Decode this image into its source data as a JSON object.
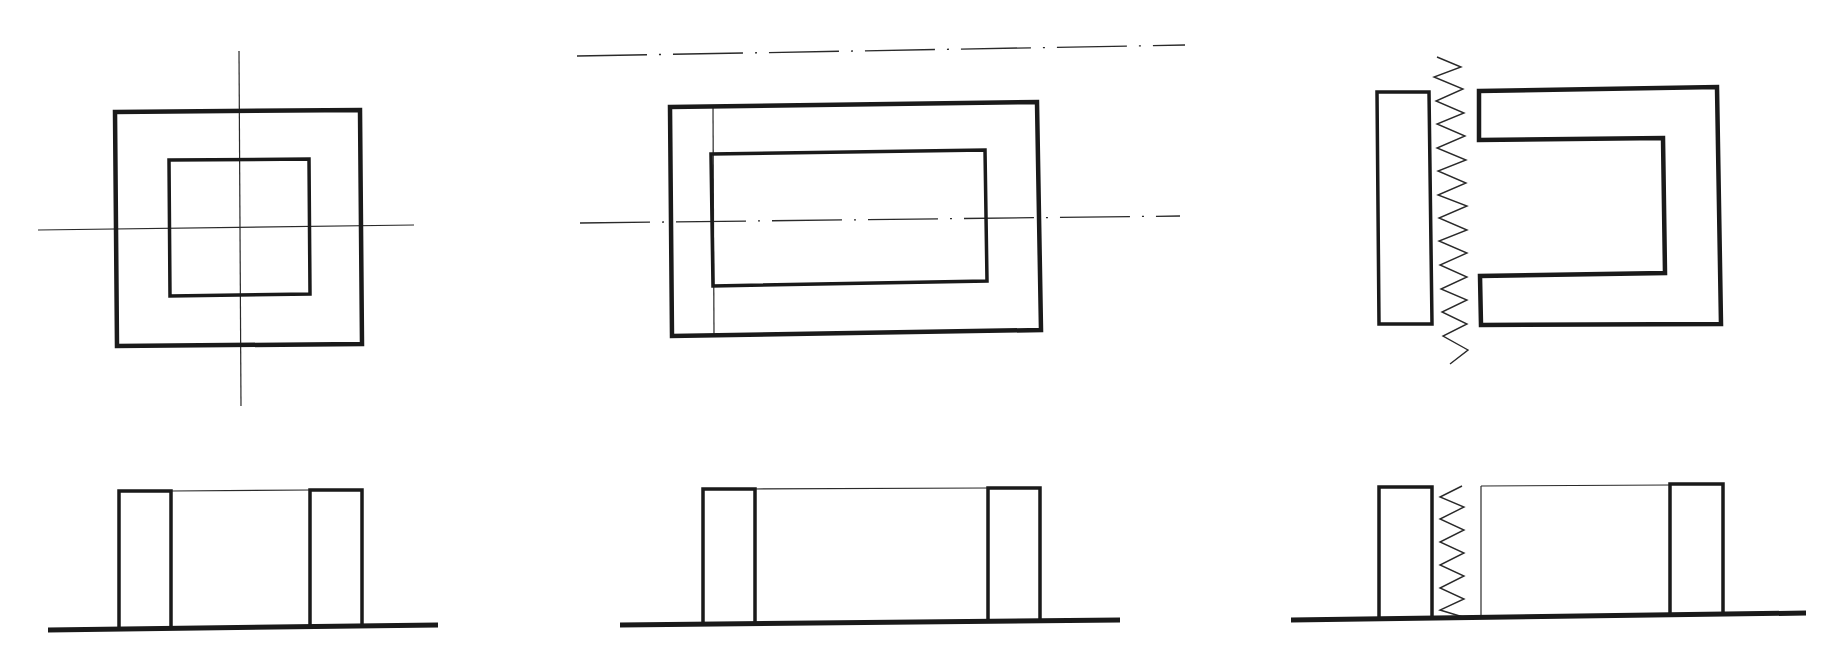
{
  "figure": {
    "title": "",
    "colors": {
      "background": "#ffffff",
      "stroke": "#1a1a1a",
      "thin_stroke": "#2a2a2a"
    }
  },
  "views": {
    "fig1_plan": {
      "outer": "M115,112 L360,110 L362,344 L117,346 Z",
      "inner": "M169,160 L309,159 L310,294 L170,296 Z",
      "centerline_h": "M38,230 L414,225",
      "centerline_v": "M239,51 L241,406"
    },
    "fig2_plan": {
      "top_axis": "M577,56 L1185,45",
      "outer": "M670,107 L1037,102 L1041,330 L672,336 Z",
      "inner": "M711,154 L985,150 L987,281 L713,286 Z",
      "thin_vertical": "M713,107 L714,335",
      "centerline": "M580,223 L1180,216"
    },
    "fig3_plan": {
      "i_bar": "M1377,92 L1429,92 L1432,324 L1379,324 Z",
      "c_core": "M1479,91 L1717,87 L1721,324 L1481,325 L1480,276 L1665,273 L1663,138 L1479,140 Z",
      "winding": "M1437,57 L1461,67 L1434,77 L1463,89 L1436,101 L1464,113 L1437,124 L1465,136 L1437,148 L1466,160 L1438,171 L1466,183 L1438,195 L1467,206 L1439,218 L1467,230 L1439,241 L1467,253 L1440,265 L1467,277 L1441,289 L1467,300 L1442,312 L1467,324 L1443,336 L1468,350 L1450,364"
    },
    "fig1_side": {
      "ground": "M48,630 L438,625",
      "left_post": "M119,627 L119,491 L171,491 L171,627",
      "right_post": "M310,626 L310,490 L362,490 L362,625",
      "top_edge": "M171,491 L310,490"
    },
    "fig2_side": {
      "ground": "M620,625 L1120,620",
      "left_post": "M703,624 L703,489 L755,489 L755,624",
      "right_post": "M988,622 L988,488 L1040,488 L1040,621",
      "top_edge": "M755,489 L988,488"
    },
    "fig3_side": {
      "ground": "M1291,620 L1806,613",
      "left_post": "M1379,618 L1379,487 L1432,487 L1432,617",
      "right_post": "M1670,614 L1670,484 L1723,484 L1723,613",
      "inner_edge": "M1481,486 L1481,616",
      "top_edge": "M1481,486 L1670,485",
      "winding": "M1462,486 L1440,497 L1464,507 L1440,519 L1464,530 L1440,542 L1464,553 L1440,565 L1464,576 L1440,588 L1464,599 L1440,610 L1463,617"
    }
  },
  "labels": {
    "fig1": "Square core",
    "fig2": "Rectangular core",
    "fig3": "C-core with I-bar and winding"
  }
}
